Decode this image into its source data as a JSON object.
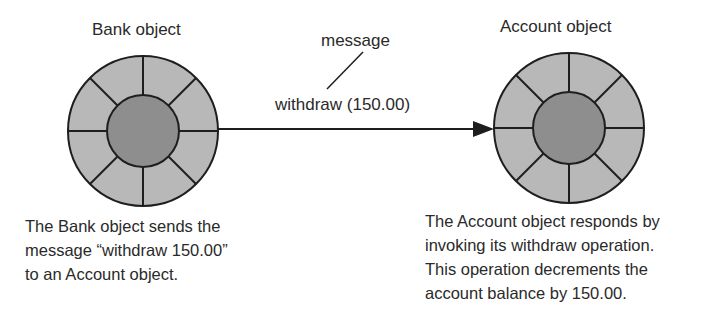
{
  "diagram": {
    "sender": {
      "title": "Bank object",
      "caption_lines": [
        "The Bank object sends the",
        "message “withdraw 150.00”",
        "to an Account object."
      ]
    },
    "receiver": {
      "title": "Account object",
      "caption_lines": [
        "The Account object responds by",
        "invoking its withdraw operation.",
        "This operation decrements the",
        "account balance by 150.00."
      ]
    },
    "message": {
      "callout_label": "message",
      "arrow_label": "withdraw (150.00)"
    },
    "colors": {
      "outer_ring": "#b8b8b8",
      "inner_core": "#8e8e8e",
      "stroke": "#1e1e1e",
      "text": "#2a2a2a"
    }
  }
}
